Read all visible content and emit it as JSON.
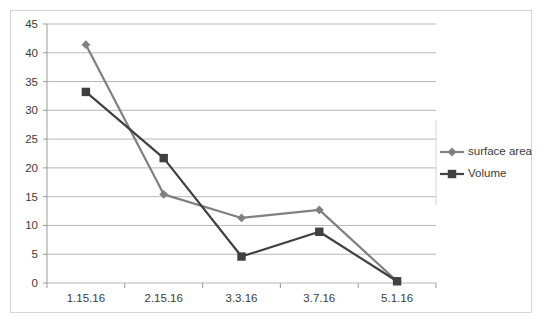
{
  "chart_data": {
    "type": "line",
    "title": "",
    "xlabel": "",
    "ylabel": "",
    "categories": [
      "1.15.16",
      "2.15.16",
      "3.3.16",
      "3.7.16",
      "5.1.16"
    ],
    "ylim": [
      0,
      45
    ],
    "ytick_step": 5,
    "yticks": [
      "45",
      "40",
      "35",
      "30",
      "25",
      "20",
      "15",
      "10",
      "5",
      "0"
    ],
    "grid": true,
    "legend_position": "right",
    "series": [
      {
        "name": "surface area",
        "marker": "diamond",
        "color": "#808080",
        "values": [
          41.4,
          15.4,
          11.3,
          12.7,
          0.3
        ]
      },
      {
        "name": "Volume",
        "marker": "square",
        "color": "#404040",
        "values": [
          33.2,
          21.7,
          4.6,
          8.9,
          0.3
        ]
      }
    ]
  },
  "legend": {
    "items": [
      {
        "label": "surface area",
        "marker": "diamond-marker",
        "color": "#808080"
      },
      {
        "label": "Volume",
        "marker": "square-marker",
        "color": "#404040"
      }
    ]
  },
  "colors": {
    "surface_area": "#808080",
    "volume": "#404040",
    "gridline": "#b7b7b7",
    "axis": "#9a9a9a",
    "frame": "#d4d4d4",
    "text": "#3b3b3b",
    "background": "#ffffff"
  }
}
